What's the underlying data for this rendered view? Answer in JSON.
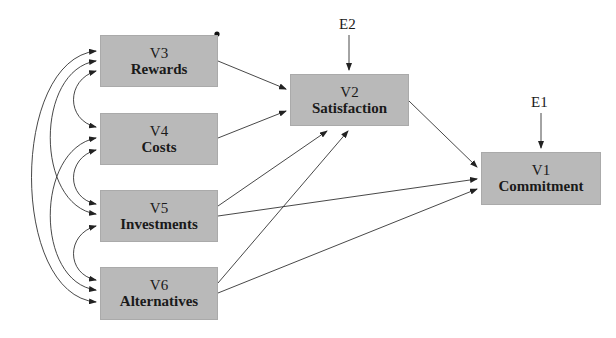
{
  "diagram": {
    "type": "path-model",
    "nodes": [
      {
        "id": "V3",
        "code": "V3",
        "name": "Rewards"
      },
      {
        "id": "V4",
        "code": "V4",
        "name": "Costs"
      },
      {
        "id": "V5",
        "code": "V5",
        "name": "Investments"
      },
      {
        "id": "V6",
        "code": "V6",
        "name": "Alternatives"
      },
      {
        "id": "V2",
        "code": "V2",
        "name": "Satisfaction"
      },
      {
        "id": "V1",
        "code": "V1",
        "name": "Commitment"
      }
    ],
    "errors": [
      {
        "id": "E2",
        "label": "E2",
        "target": "V2"
      },
      {
        "id": "E1",
        "label": "E1",
        "target": "V1"
      }
    ],
    "paths": [
      {
        "from": "V3",
        "to": "V2"
      },
      {
        "from": "V4",
        "to": "V2"
      },
      {
        "from": "V5",
        "to": "V2"
      },
      {
        "from": "V6",
        "to": "V2"
      },
      {
        "from": "V2",
        "to": "V1"
      },
      {
        "from": "V5",
        "to": "V1"
      },
      {
        "from": "V6",
        "to": "V1"
      },
      {
        "from": "E2",
        "to": "V2"
      },
      {
        "from": "E1",
        "to": "V1"
      }
    ],
    "covariances": [
      [
        "V3",
        "V4"
      ],
      [
        "V3",
        "V5"
      ],
      [
        "V3",
        "V6"
      ],
      [
        "V4",
        "V5"
      ],
      [
        "V4",
        "V6"
      ],
      [
        "V5",
        "V6"
      ]
    ],
    "colors": {
      "box": "#b9b9b9",
      "line": "#333333",
      "text": "#1a1a1a"
    }
  }
}
